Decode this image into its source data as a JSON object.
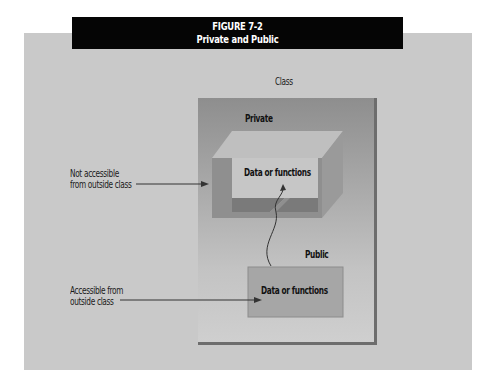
{
  "figure": {
    "number": "FIGURE 7-2",
    "title": "Private and Public"
  },
  "diagram": {
    "class_label": "Class",
    "private_label": "Private",
    "public_label": "Public",
    "private_box_text": "Data or functions",
    "public_box_text": "Data or functions",
    "annotations": [
      {
        "line1": "Not accessible",
        "line2": "from outside class"
      },
      {
        "line1": "Accessible from",
        "line2": "outside class"
      }
    ]
  },
  "colors": {
    "title_bar": "#050505",
    "panel": "#c9c9c9",
    "class_box_top": "#8e8e8e",
    "class_box_bottom": "#cfcfcf",
    "private_front": "#8f8f8f",
    "private_top": "#bdbdbd",
    "public_box": "#a6a6a6"
  }
}
